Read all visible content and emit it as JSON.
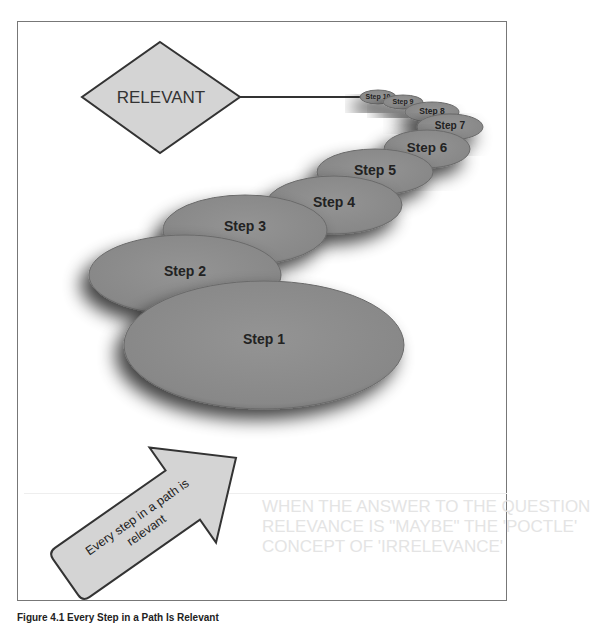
{
  "diagram": {
    "decision": {
      "label": "RELEVANT",
      "shape": "diamond",
      "fill": "#d4d4d4"
    },
    "steps": [
      {
        "label": "Step 1",
        "cx": 264,
        "cy": 345,
        "rx": 140,
        "ry": 64
      },
      {
        "label": "Step 2",
        "cx": 185,
        "cy": 275,
        "rx": 96,
        "ry": 40
      },
      {
        "label": "Step 3",
        "cx": 245,
        "cy": 230,
        "rx": 82,
        "ry": 35
      },
      {
        "label": "Step 4",
        "cx": 334,
        "cy": 205,
        "rx": 68,
        "ry": 29
      },
      {
        "label": "Step 5",
        "cx": 375,
        "cy": 172,
        "rx": 58,
        "ry": 23
      },
      {
        "label": "Step 6",
        "cx": 427,
        "cy": 149,
        "rx": 43,
        "ry": 19
      },
      {
        "label": "Step 7",
        "cx": 450,
        "cy": 127,
        "rx": 33,
        "ry": 13
      },
      {
        "label": "Step 8",
        "cx": 432,
        "cy": 112,
        "rx": 27,
        "ry": 10
      },
      {
        "label": "Step 9",
        "cx": 403,
        "cy": 102,
        "rx": 20,
        "ry": 7
      },
      {
        "label": "Step 10",
        "cx": 378,
        "cy": 97,
        "rx": 18,
        "ry": 7
      }
    ],
    "step_fill": "#8c8c8c",
    "arrow": {
      "label_line1": "Every step in a path is",
      "label_line2": "relevant",
      "fill": "#d4d4d4"
    }
  },
  "background_bleed": {
    "heading_lines": [
      "WHEN THE ANSWER TO THE QUESTION",
      "RELEVANCE IS \"MAYBE\" THE 'POCTLE'",
      "CONCEPT OF 'IRRELEVANCE'"
    ]
  },
  "caption": "Figure 4.1 Every Step in a Path Is Relevant"
}
